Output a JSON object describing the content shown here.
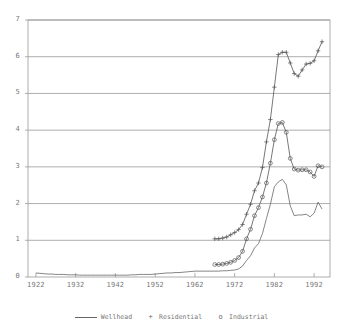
{
  "chart_data": {
    "type": "line",
    "title": "",
    "xlabel": "",
    "ylabel": "",
    "xlim": [
      1920,
      1996
    ],
    "ylim": [
      0,
      7
    ],
    "yticks": [
      0,
      1,
      2,
      3,
      4,
      5,
      6,
      7
    ],
    "xticks": [
      1922,
      1932,
      1942,
      1952,
      1962,
      1972,
      1982,
      1992
    ],
    "grid": "horizontal",
    "legend_position": "bottom",
    "series": [
      {
        "name": "Wellhead",
        "marker": "none",
        "style": "line",
        "color": "#666666",
        "x": [
          1922,
          1923,
          1924,
          1925,
          1926,
          1927,
          1928,
          1929,
          1930,
          1931,
          1932,
          1933,
          1934,
          1935,
          1936,
          1937,
          1938,
          1939,
          1940,
          1941,
          1942,
          1943,
          1944,
          1945,
          1946,
          1947,
          1948,
          1949,
          1950,
          1951,
          1952,
          1953,
          1954,
          1955,
          1956,
          1957,
          1958,
          1959,
          1960,
          1961,
          1962,
          1963,
          1964,
          1965,
          1966,
          1967,
          1968,
          1969,
          1970,
          1971,
          1972,
          1973,
          1974,
          1975,
          1976,
          1977,
          1978,
          1979,
          1980,
          1981,
          1982,
          1983,
          1984,
          1985,
          1986,
          1987,
          1988,
          1989,
          1990,
          1991,
          1992,
          1993,
          1994
        ],
        "y": [
          0.11,
          0.1,
          0.09,
          0.08,
          0.08,
          0.07,
          0.07,
          0.07,
          0.06,
          0.06,
          0.06,
          0.05,
          0.05,
          0.05,
          0.05,
          0.05,
          0.05,
          0.05,
          0.05,
          0.05,
          0.05,
          0.05,
          0.05,
          0.05,
          0.06,
          0.06,
          0.07,
          0.07,
          0.07,
          0.07,
          0.08,
          0.09,
          0.1,
          0.11,
          0.11,
          0.12,
          0.12,
          0.13,
          0.14,
          0.15,
          0.16,
          0.16,
          0.16,
          0.16,
          0.16,
          0.16,
          0.16,
          0.17,
          0.17,
          0.18,
          0.19,
          0.22,
          0.3,
          0.45,
          0.58,
          0.79,
          0.91,
          1.18,
          1.59,
          1.98,
          2.46,
          2.59,
          2.66,
          2.51,
          1.94,
          1.67,
          1.69,
          1.69,
          1.71,
          1.64,
          1.74,
          2.04,
          1.85
        ]
      },
      {
        "name": "Residential",
        "marker": "+",
        "style": "line+marker",
        "color": "#555555",
        "x": [
          1967,
          1968,
          1969,
          1970,
          1971,
          1972,
          1973,
          1974,
          1975,
          1976,
          1977,
          1978,
          1979,
          1980,
          1981,
          1982,
          1983,
          1984,
          1985,
          1986,
          1987,
          1988,
          1989,
          1990,
          1991,
          1992,
          1993,
          1994
        ],
        "y": [
          1.04,
          1.04,
          1.06,
          1.09,
          1.15,
          1.21,
          1.29,
          1.43,
          1.71,
          1.98,
          2.35,
          2.56,
          2.98,
          3.68,
          4.29,
          5.17,
          6.06,
          6.12,
          6.12,
          5.83,
          5.54,
          5.47,
          5.64,
          5.8,
          5.82,
          5.89,
          6.16,
          6.41
        ]
      },
      {
        "name": "Industrial",
        "marker": "o",
        "style": "line+marker",
        "color": "#555555",
        "x": [
          1967,
          1968,
          1969,
          1970,
          1971,
          1972,
          1973,
          1974,
          1975,
          1976,
          1977,
          1978,
          1979,
          1980,
          1981,
          1982,
          1983,
          1984,
          1985,
          1986,
          1987,
          1988,
          1989,
          1990,
          1991,
          1992,
          1993,
          1994
        ],
        "y": [
          0.34,
          0.34,
          0.35,
          0.37,
          0.4,
          0.45,
          0.53,
          0.7,
          1.04,
          1.3,
          1.67,
          1.89,
          2.18,
          2.56,
          3.1,
          3.74,
          4.18,
          4.21,
          3.94,
          3.23,
          2.94,
          2.91,
          2.92,
          2.92,
          2.86,
          2.74,
          3.03,
          3.0
        ]
      }
    ]
  },
  "axis": {
    "y_labels": [
      "0",
      "1",
      "2",
      "3",
      "4",
      "5",
      "6",
      "7"
    ],
    "x_labels": [
      "1922",
      "1932",
      "1942",
      "1952",
      "1962",
      "1972",
      "1982",
      "1992"
    ]
  },
  "legend": {
    "items": [
      {
        "label": "Wellhead",
        "glyph": "line-swatch"
      },
      {
        "label": "Residential",
        "glyph": "plus-marker"
      },
      {
        "label": "Industrial",
        "glyph": "circle-marker"
      }
    ]
  },
  "colors": {
    "frame": "#9a9a9a",
    "grid": "#8a8a8a",
    "series": "#666666",
    "text": "#777777",
    "background": "#ffffff"
  }
}
